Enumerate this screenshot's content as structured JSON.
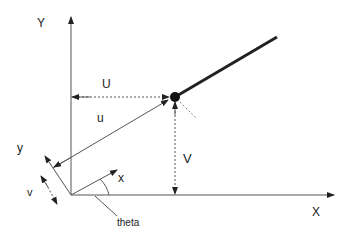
{
  "diagram": {
    "type": "vector decomposition diagram",
    "labels": {
      "Y_axis": "Y",
      "X_axis": "X",
      "U": "U",
      "V": "V",
      "u": "u",
      "y": "y",
      "x": "x",
      "v": "v",
      "theta": "theta"
    },
    "colors": {
      "line": "#222222",
      "background": "#ffffff"
    }
  }
}
